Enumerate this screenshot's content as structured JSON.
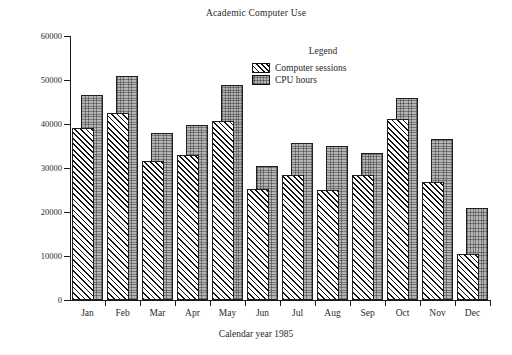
{
  "chart_data": {
    "type": "bar",
    "title": "Academic Computer Use",
    "xlabel": "Calendar year 1985",
    "ylabel": "",
    "categories": [
      "Jan",
      "Feb",
      "Mar",
      "Apr",
      "May",
      "Jun",
      "Jul",
      "Aug",
      "Sep",
      "Oct",
      "Nov",
      "Dec"
    ],
    "series": [
      {
        "name": "Computer sessions",
        "fill": "diagonal-hatch",
        "values": [
          39000,
          42500,
          31500,
          33000,
          40600,
          25300,
          28300,
          25000,
          28300,
          41200,
          26800,
          10500
        ]
      },
      {
        "name": "CPU hours",
        "fill": "gray-stipple",
        "values": [
          46700,
          51000,
          38000,
          39800,
          48800,
          30500,
          35700,
          35100,
          33500,
          45800,
          36500,
          21000
        ]
      }
    ],
    "ylim": [
      0,
      60000
    ],
    "ytick_values": [
      0,
      10000,
      20000,
      30000,
      40000,
      50000,
      60000
    ],
    "ytick_labels": [
      "0",
      "10000",
      "20000",
      "30000",
      "40000",
      "50000",
      "60000"
    ],
    "grid": false,
    "legend_position": "upper-right-inside",
    "legend_title": "Legend",
    "colors": {
      "axis": "#1a1a1a",
      "bar_outline": "#1f1f1f",
      "cpu_hours_fill": "#b5b5b5",
      "sessions_fill": "#ffffff",
      "background": "#ffffff",
      "text": "#2a2a2a"
    }
  }
}
